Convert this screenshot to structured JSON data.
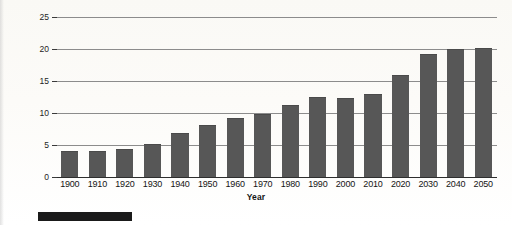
{
  "chart_data": {
    "type": "bar",
    "title": "",
    "xlabel": "Year",
    "ylabel": "Percentage of Population",
    "categories": [
      "1900",
      "1910",
      "1920",
      "1930",
      "1940",
      "1950",
      "1960",
      "1970",
      "1980",
      "1990",
      "2000",
      "2010",
      "2020",
      "2030",
      "2040",
      "2050"
    ],
    "values": [
      4.0,
      4.1,
      4.3,
      5.2,
      6.8,
      8.1,
      9.2,
      9.9,
      11.2,
      12.5,
      12.3,
      13.0,
      16.0,
      19.2,
      20.0,
      20.1
    ],
    "ylim": [
      0,
      25
    ],
    "yticks": [
      0,
      5,
      10,
      15,
      20,
      25
    ],
    "ytick_labels": [
      "0",
      "5",
      "10",
      "15",
      "20",
      "25"
    ],
    "grid": true,
    "legend": "none",
    "bar_color": "#575757",
    "gridline_color": "#8c8c8c",
    "axis_color": "#2e2e2e",
    "background_color": "#fbfaf7"
  },
  "artifacts": {
    "scan_bar_label": ""
  }
}
